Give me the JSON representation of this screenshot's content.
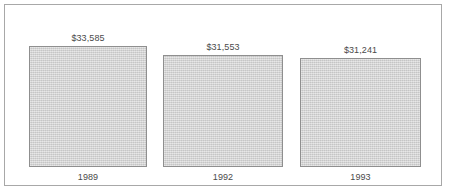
{
  "chart_data": {
    "type": "bar",
    "title": "",
    "subtitle": "",
    "xlabel": "",
    "ylabel": "",
    "categories": [
      "1989",
      "1992",
      "1993"
    ],
    "values": [
      33585,
      31553,
      31241
    ],
    "data_labels": [
      "$33,585",
      "$31,553",
      "$31,241"
    ],
    "legend": [],
    "legend_position": "none",
    "grid": false,
    "axis_line": false,
    "value_prefix": "$",
    "series": [
      {
        "name": "",
        "values": [
          33585,
          31553,
          31241
        ]
      }
    ]
  },
  "colors": {
    "bar_fill": "#d3d3d3",
    "bar_border": "#8f8f8f",
    "frame_border": "#a8a8a8",
    "text": "#4a4a4a",
    "background": "#ffffff"
  },
  "bars": [
    {
      "category": "1989",
      "value": 33585,
      "label": "$33,585",
      "x": 29,
      "y": 46,
      "width": 118,
      "height": 121
    },
    {
      "category": "1992",
      "value": 31553,
      "label": "$31,553",
      "x": 163,
      "y": 55,
      "width": 120,
      "height": 112
    },
    {
      "category": "1993",
      "value": 31241,
      "label": "$31,241",
      "x": 300,
      "y": 58,
      "width": 121,
      "height": 109
    }
  ]
}
